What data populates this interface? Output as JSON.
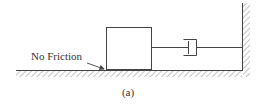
{
  "diagram": {
    "type": "mass-damper system",
    "colors": {
      "line": "#444444",
      "hatch": "#888888",
      "background": "#ffffff"
    },
    "labels": {
      "friction_note": "No Friction",
      "caption": "(a)"
    },
    "components": [
      {
        "name": "mass",
        "shape": "rectangle"
      },
      {
        "name": "dashpot",
        "shape": "damper"
      },
      {
        "name": "wall",
        "shape": "fixed-support-vertical"
      },
      {
        "name": "ground",
        "shape": "fixed-support-horizontal"
      }
    ]
  }
}
